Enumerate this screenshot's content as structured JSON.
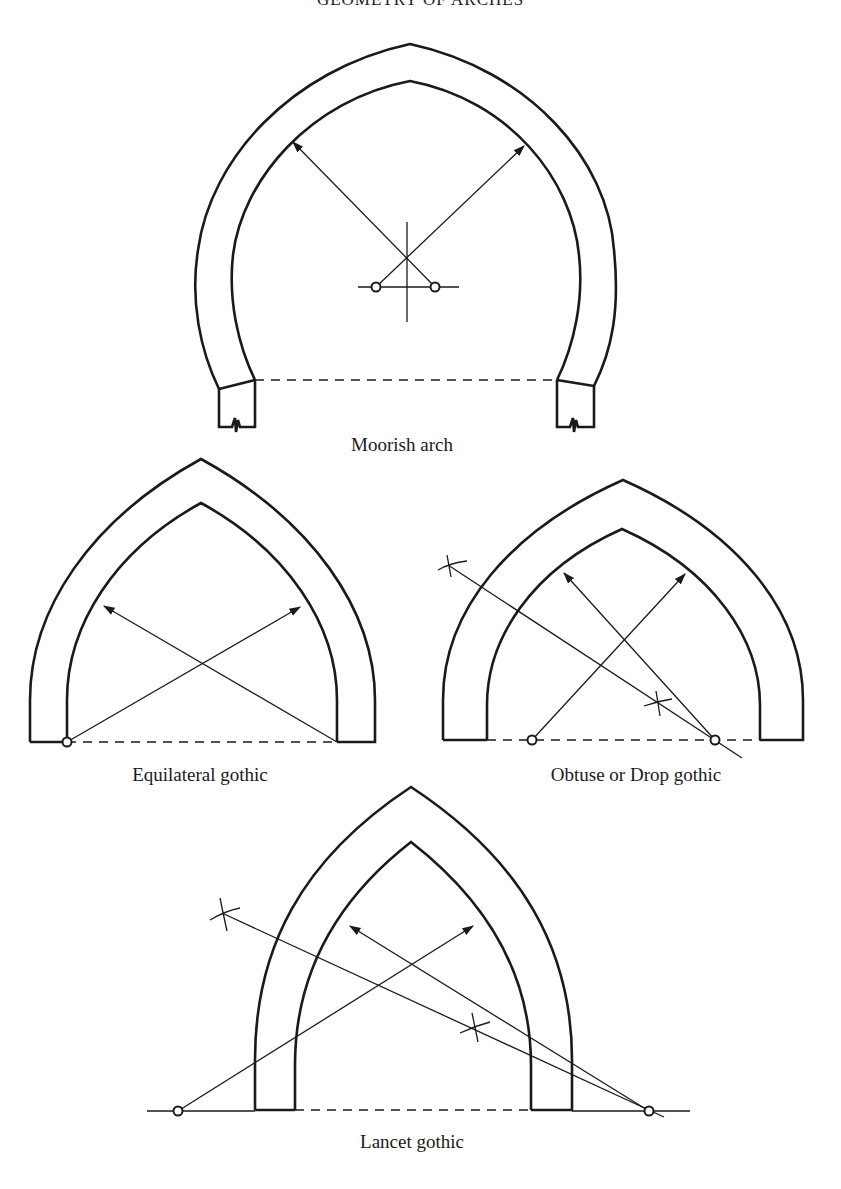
{
  "page": {
    "heading": "GEOMETRY OF ARCHES"
  },
  "figures": [
    {
      "id": "moorish",
      "caption": "Moorish arch"
    },
    {
      "id": "equilateral",
      "caption": "Equilateral gothic"
    },
    {
      "id": "obtuse",
      "caption": "Obtuse or Drop gothic"
    },
    {
      "id": "lancet",
      "caption": "Lancet gothic"
    }
  ],
  "colors": {
    "ink": "#1a1a1a",
    "paper": "#ffffff"
  }
}
